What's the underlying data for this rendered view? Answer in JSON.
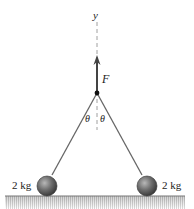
{
  "diagram": {
    "axis_label": "y",
    "force_label": "F",
    "angle_left_label": "θ",
    "angle_right_label": "θ",
    "mass_left_label": "2 kg",
    "mass_right_label": "2 kg"
  },
  "colors": {
    "line": "#555555",
    "ball": "#6a6a6a",
    "ground": "#9a9a9a"
  }
}
